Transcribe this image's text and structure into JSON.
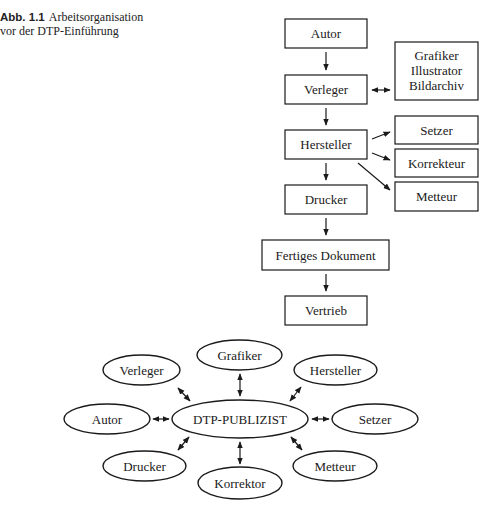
{
  "caption": {
    "label": "Abb. 1.1",
    "line1": "Arbeitsorganisation",
    "line2": "vor der DTP-Einführung"
  },
  "flowchart": {
    "boxes": {
      "autor": "Autor",
      "verleger": "Verleger",
      "grafiker_line1": "Grafiker",
      "grafiker_line2": "Illustrator",
      "grafiker_line3": "Bildarchiv",
      "hersteller": "Hersteller",
      "setzer": "Setzer",
      "korrekteur": "Korrekteur",
      "metteur": "Metteur",
      "drucker": "Drucker",
      "fertiges_dokument": "Fertiges Dokument",
      "vertrieb": "Vertrieb"
    },
    "edges": [
      {
        "from": "Autor",
        "to": "Verleger",
        "type": "arrow"
      },
      {
        "from": "Verleger",
        "to": "Grafiker/Illustrator/Bildarchiv",
        "type": "bidirectional"
      },
      {
        "from": "Verleger",
        "to": "Hersteller",
        "type": "arrow"
      },
      {
        "from": "Hersteller",
        "to": "Setzer",
        "type": "arrow"
      },
      {
        "from": "Hersteller",
        "to": "Korrekteur",
        "type": "arrow"
      },
      {
        "from": "Hersteller",
        "to": "Metteur",
        "type": "arrow"
      },
      {
        "from": "Hersteller",
        "to": "Drucker",
        "type": "arrow"
      },
      {
        "from": "Drucker",
        "to": "Fertiges Dokument",
        "type": "arrow"
      },
      {
        "from": "Fertiges Dokument",
        "to": "Vertrieb",
        "type": "arrow"
      }
    ]
  },
  "hub": {
    "center": "DTP-PUBLIZIST",
    "nodes": {
      "grafiker": "Grafiker",
      "verleger": "Verleger",
      "hersteller": "Hersteller",
      "autor": "Autor",
      "setzer": "Setzer",
      "drucker": "Drucker",
      "korrektor": "Korrektor",
      "metteur": "Metteur"
    },
    "edge_type": "bidirectional"
  }
}
